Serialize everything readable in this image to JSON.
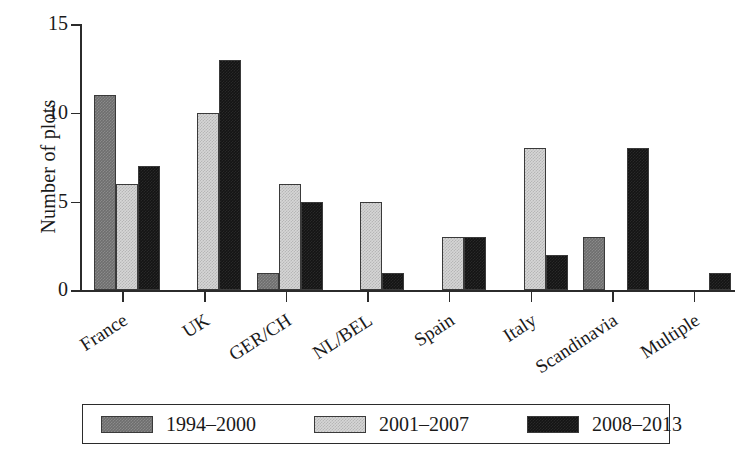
{
  "chart_data": {
    "type": "bar",
    "title": "",
    "xlabel": "",
    "ylabel": "Number of plots",
    "ylim": [
      0,
      15
    ],
    "yticks": [
      0,
      5,
      10,
      15
    ],
    "grid": false,
    "legend_position": "bottom",
    "categories": [
      "France",
      "UK",
      "GER/CH",
      "NL/BEL",
      "Spain",
      "Italy",
      "Scandinavia",
      "Multiple"
    ],
    "series": [
      {
        "name": "1994–2000",
        "color": "#6e6e6e",
        "values": [
          11,
          0,
          1,
          0,
          0,
          0,
          3,
          0
        ]
      },
      {
        "name": "2001–2007",
        "color": "#d6d6d6",
        "values": [
          6,
          10,
          6,
          5,
          3,
          8,
          0,
          0
        ]
      },
      {
        "name": "2008–2013",
        "color": "#141414",
        "values": [
          7,
          13,
          5,
          1,
          3,
          2,
          8,
          1
        ]
      }
    ]
  },
  "axes": {
    "y_title": "Number of plots",
    "y_tick_labels": [
      "0",
      "5",
      "10",
      "15"
    ],
    "x_tick_labels": [
      "France",
      "UK",
      "GER/CH",
      "NL/BEL",
      "Spain",
      "Italy",
      "Scandinavia",
      "Multiple"
    ]
  },
  "legend": {
    "entries": [
      {
        "label": "1994–2000",
        "color": "#6e6e6e"
      },
      {
        "label": "2001–2007",
        "color": "#d6d6d6"
      },
      {
        "label": "2008–2013",
        "color": "#141414"
      }
    ]
  }
}
